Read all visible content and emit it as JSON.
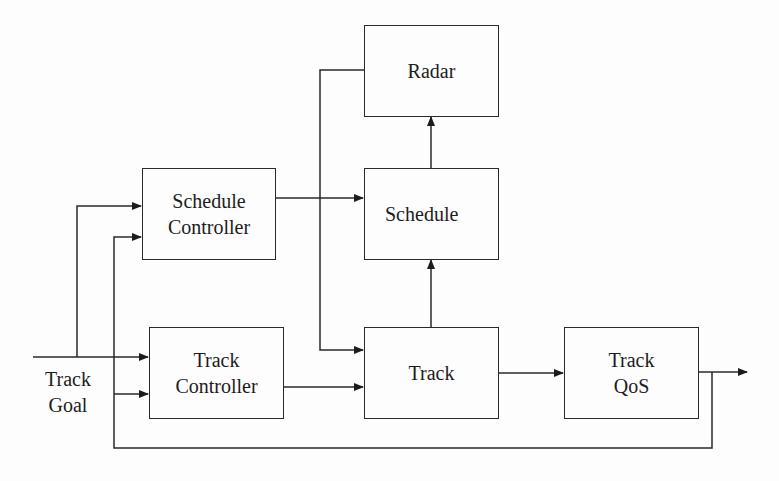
{
  "diagram": {
    "type": "block-diagram",
    "blocks": [
      {
        "id": "radar",
        "label": "Radar"
      },
      {
        "id": "schedule",
        "label": "Schedule"
      },
      {
        "id": "schedule_controller",
        "label_line1": "Schedule",
        "label_line2": "Controller"
      },
      {
        "id": "track_controller",
        "label_line1": "Track",
        "label_line2": "Controller"
      },
      {
        "id": "track",
        "label": "Track"
      },
      {
        "id": "track_qos",
        "label_line1": "Track",
        "label_line2": "QoS"
      }
    ],
    "input_label": {
      "line1": "Track",
      "line2": "Goal"
    },
    "edges": [
      {
        "from": "input",
        "to": "schedule_controller"
      },
      {
        "from": "input",
        "to": "track_controller"
      },
      {
        "from": "schedule_controller",
        "to": "schedule"
      },
      {
        "from": "radar",
        "to": "track"
      },
      {
        "from": "track_controller",
        "to": "track"
      },
      {
        "from": "track",
        "to": "schedule"
      },
      {
        "from": "schedule",
        "to": "radar"
      },
      {
        "from": "track",
        "to": "track_qos"
      },
      {
        "from": "track_qos",
        "to": "output"
      },
      {
        "from": "track_qos",
        "to": "schedule_controller",
        "note": "feedback"
      },
      {
        "from": "track_qos",
        "to": "track_controller",
        "note": "feedback"
      }
    ]
  }
}
